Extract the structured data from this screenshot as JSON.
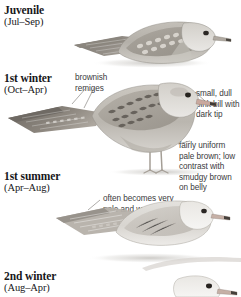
{
  "plate": {
    "background_color": "#ffffff",
    "text_color": "#17171a",
    "annotation_color": "#3a3a3c",
    "plumage_base": "#b9b5ae",
    "plumage_dark": "#6f6a64",
    "plumage_pale": "#e6e4e0",
    "bill_pink": "#c9a89e"
  },
  "stages": [
    {
      "id": "juvenile",
      "name": "Juvenile",
      "months": "(Jul–Sep)"
    },
    {
      "id": "first-winter",
      "name": "1st winter",
      "months": "(Oct–Apr)"
    },
    {
      "id": "first-summer",
      "name": "1st summer",
      "months": "(Apr–Aug)"
    },
    {
      "id": "second-winter",
      "name": "2nd winter",
      "months": "(Aug–Apr)"
    }
  ],
  "annotations": [
    {
      "id": "brownish-remiges",
      "text": "brownish remiges"
    },
    {
      "id": "small-dull-pink-bill",
      "text": "small, dull pink bill with dark tip"
    },
    {
      "id": "fairly-uniform-pale-brown",
      "text": "fairly uniform pale brown; low contrast with smudgy brown on belly"
    },
    {
      "id": "often-pale-and-worn",
      "text": "often becomes very pale and worn"
    }
  ],
  "birds": [
    {
      "id": "juvenile-bird",
      "posture": "sitting",
      "description": "juvenile gull, scalloped upperpart pattern"
    },
    {
      "id": "first-winter-bird",
      "posture": "standing",
      "description": "1st winter gull standing with legs"
    },
    {
      "id": "first-summer-bird",
      "posture": "sitting",
      "description": "1st summer gull, very pale and worn"
    },
    {
      "id": "second-winter-bird",
      "posture": "sitting",
      "description": "2nd winter gull, head only, cropped at page edge"
    }
  ]
}
